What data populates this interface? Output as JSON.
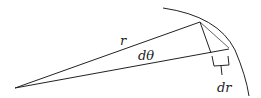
{
  "diagram": {
    "labels": {
      "radius": "r",
      "angle": "dθ",
      "radial_change": "dr"
    },
    "colors": {
      "stroke": "#222222",
      "background": "#ffffff"
    }
  }
}
